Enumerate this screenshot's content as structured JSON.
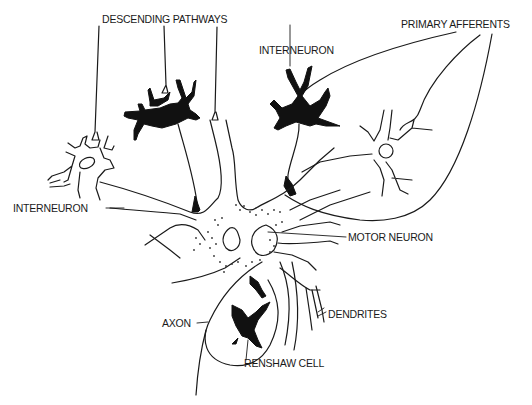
{
  "diagram": {
    "type": "neuron anatomy illustration",
    "labels": {
      "descending_pathways": "DESCENDING PATHWAYS",
      "interneuron_top": "INTERNEURON",
      "primary_afferents": "PRIMARY AFFERENTS",
      "interneuron_left": "INTERNEURON",
      "motor_neuron": "MOTOR NEURON",
      "axon": "AXON",
      "dendrites": "DENDRITES",
      "renshaw_cell": "RENSHAW CELL"
    },
    "colors": {
      "background": "#ffffff",
      "line": "#1a1a1a",
      "filled_cells": "#111111"
    }
  }
}
